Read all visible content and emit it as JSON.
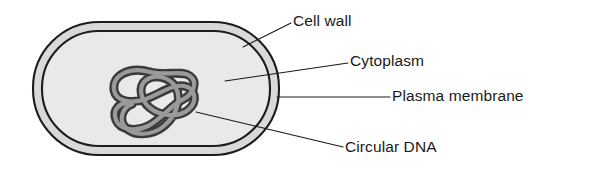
{
  "figure": {
    "type": "biological-diagram",
    "background_color": "#ffffff"
  },
  "colors": {
    "outline": "#1c1c1c",
    "cell_wall_band": "#d9d9d9",
    "cytoplasm": "#e9e9e9",
    "dna_outline": "#3a3a3a",
    "dna_core": "#9a9a9a",
    "label_text": "#1a1a1a",
    "leader_line": "#1a1a1a"
  },
  "labels": [
    {
      "id": "cell-wall",
      "text": "Cell wall",
      "x": 293,
      "y": 22,
      "leader": "M 243 47 L 291 23"
    },
    {
      "id": "cytoplasm",
      "text": "Cytoplasm",
      "x": 350,
      "y": 62,
      "leader": "M 225 81 L 348 63"
    },
    {
      "id": "plasma-membrane",
      "text": "Plasma membrane",
      "x": 392,
      "y": 97,
      "leader": "M 277 97 L 390 97"
    },
    {
      "id": "circular-dna",
      "text": "Circular DNA",
      "x": 345,
      "y": 148,
      "leader": "M 196 112 L 343 147"
    }
  ],
  "structures": {
    "cell_wall": {
      "name": "Cell wall",
      "shape": "rounded-rectangle-outer",
      "x": 33,
      "y": 22,
      "width": 246,
      "height": 133,
      "corner_radius": 66
    },
    "plasma_membrane": {
      "name": "Plasma membrane",
      "shape": "rounded-rectangle-inner",
      "x": 42,
      "y": 31,
      "width": 228,
      "height": 115,
      "corner_radius": 57
    },
    "cytoplasm": {
      "name": "Cytoplasm",
      "description": "light grey interior filling the cell"
    },
    "circular_dna": {
      "name": "Circular DNA",
      "description": "tangled closed loop of double-stranded DNA (nucleoid)",
      "bounds": {
        "x": 110,
        "y": 66,
        "width": 88,
        "height": 74
      }
    }
  }
}
